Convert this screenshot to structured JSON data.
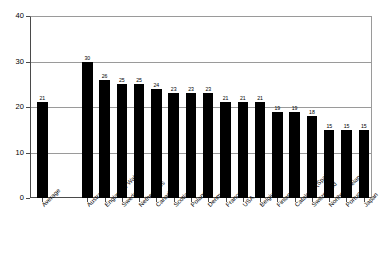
{
  "chart_data": {
    "type": "bar",
    "title": "",
    "subtitle": "",
    "xlabel": "",
    "ylabel": "",
    "ylim": [
      0,
      40
    ],
    "yticks": [
      0,
      10,
      20,
      30,
      40
    ],
    "grid": true,
    "legend": false,
    "orientation": "vertical",
    "bar_color": "#000000",
    "background_color": "#ffffff",
    "axis_color": "#4a4a4a",
    "gridline_color": "#9a9a9a",
    "categories": [
      "Average",
      "Australia",
      "England & Wales",
      "Sweden",
      "Netherlands",
      "Canada",
      "Scotland",
      "Poland",
      "Denmark",
      "France",
      "USA",
      "Belgium",
      "Finland",
      "Catalonia (Spain)",
      "Switzerland",
      "Northern Ireland",
      "Portugal",
      "Japan"
    ],
    "values": [
      21,
      30,
      26,
      25,
      25,
      24,
      23,
      23,
      23,
      21,
      21,
      21,
      19,
      19,
      18,
      15,
      15,
      15
    ],
    "data_labels": [
      "21",
      "30",
      "26",
      "25",
      "25",
      "24",
      "23",
      "23",
      "23",
      "21",
      "21",
      "21",
      "19",
      "19",
      "18",
      "15",
      "15",
      "15"
    ],
    "ytick_labels": [
      "0",
      "10",
      "20",
      "30",
      "40"
    ]
  }
}
